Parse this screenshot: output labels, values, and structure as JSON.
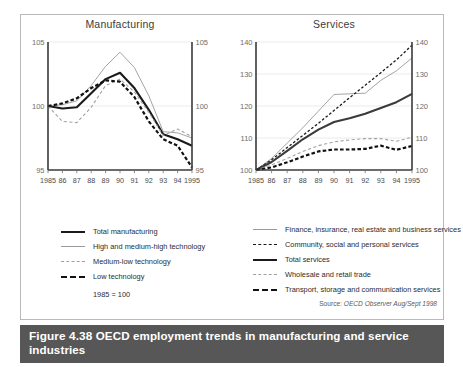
{
  "figure": {
    "number": "Figure 4.38",
    "caption": "OECD employment trends in manufacturing and service industries",
    "source_label": "Source:",
    "source_value": "OECD Observer Aug/Sept 1998"
  },
  "panels": {
    "manufacturing": {
      "title": "Manufacturing",
      "note": "1985 = 100",
      "legend": [
        {
          "label": "Total manufacturing",
          "style": "sw-solid-thick"
        },
        {
          "label": "High and medium-high technology",
          "style": "sw-solid-thin"
        },
        {
          "label": "Medium-low technology",
          "style": "sw-dash-gray"
        },
        {
          "label": "Low technology",
          "style": "sw-dash-black"
        }
      ]
    },
    "services": {
      "title": "Services",
      "legend": [
        {
          "label": "Finance, insurance, real estate and business services",
          "style": "sw-solid-thin"
        },
        {
          "label": "Community, social and personal services",
          "style": "sw-dot-black"
        },
        {
          "label": "Total services",
          "style": "sw-solid-thick"
        },
        {
          "label": "Wholesale and retail trade",
          "style": "sw-dash-gray"
        },
        {
          "label": "Transport, storage and communication services",
          "style": "sw-dash-black"
        }
      ]
    }
  },
  "chart_data": [
    {
      "type": "line",
      "title": "Manufacturing",
      "xlabel": "",
      "ylabel": "",
      "x": [
        1985,
        1986,
        1987,
        1988,
        1989,
        1990,
        1991,
        1992,
        1993,
        1994,
        1995
      ],
      "tick_labels_x": [
        "1985",
        "86",
        "87",
        "88",
        "89",
        "90",
        "91",
        "92",
        "93",
        "94",
        "1995"
      ],
      "tick_labels_y": [
        "95",
        "100",
        "105"
      ],
      "ylim": [
        95,
        105
      ],
      "yticks": [
        95,
        100,
        105
      ],
      "grid": true,
      "axis_right_mirror": true,
      "note": "1985 = 100",
      "series": [
        {
          "name": "Total manufacturing",
          "style": "solid-thick",
          "color": "#1a1a1a",
          "values": [
            100.0,
            99.8,
            99.9,
            101.0,
            102.1,
            102.6,
            101.4,
            99.7,
            97.8,
            97.4,
            96.9
          ]
        },
        {
          "name": "High and medium-high technology",
          "style": "solid-thin",
          "color": "#9a9a9a",
          "values": [
            100.0,
            100.1,
            100.4,
            101.6,
            103.1,
            104.2,
            103.0,
            100.8,
            98.0,
            97.9,
            97.5
          ]
        },
        {
          "name": "Medium-low technology",
          "style": "dash-gray",
          "color": "#a3a3a3",
          "values": [
            100.0,
            98.8,
            98.7,
            99.9,
            101.6,
            102.1,
            101.1,
            99.5,
            97.7,
            98.2,
            97.6
          ]
        },
        {
          "name": "Low technology",
          "style": "dash-black",
          "color": "#111111",
          "values": [
            100.0,
            100.2,
            100.6,
            101.4,
            102.0,
            101.9,
            100.7,
            98.8,
            97.4,
            96.9,
            95.2
          ]
        }
      ]
    },
    {
      "type": "line",
      "title": "Services",
      "xlabel": "",
      "ylabel": "",
      "x": [
        1985,
        1986,
        1987,
        1988,
        1989,
        1990,
        1991,
        1992,
        1993,
        1994,
        1995
      ],
      "tick_labels_x": [
        "1985",
        "86",
        "87",
        "88",
        "89",
        "90",
        "91",
        "92",
        "93",
        "94",
        "1995"
      ],
      "tick_labels_y": [
        "100",
        "110",
        "120",
        "130",
        "140"
      ],
      "ylim": [
        100,
        140
      ],
      "yticks": [
        100,
        110,
        120,
        130,
        140
      ],
      "grid": true,
      "axis_right_mirror": true,
      "series": [
        {
          "name": "Finance, insurance, real estate and business services",
          "style": "solid-thin",
          "color": "#9a9a9a",
          "values": [
            100.0,
            103.6,
            108.4,
            113.2,
            118.4,
            123.6,
            123.8,
            124.0,
            128.0,
            131.0,
            135.0
          ]
        },
        {
          "name": "Community, social and personal services",
          "style": "dot-black",
          "color": "#1a1a1a",
          "values": [
            100.0,
            103.2,
            107.0,
            110.8,
            114.6,
            118.6,
            122.6,
            126.5,
            130.4,
            134.4,
            139.0
          ]
        },
        {
          "name": "Total services",
          "style": "solid-thick",
          "color": "#3a3a3a",
          "values": [
            100.0,
            102.5,
            106.0,
            109.6,
            112.6,
            115.0,
            116.2,
            117.6,
            119.4,
            121.2,
            123.8
          ]
        },
        {
          "name": "Wholesale and retail trade",
          "style": "dash-gray",
          "color": "#a3a3a3",
          "values": [
            100.0,
            101.6,
            103.6,
            105.8,
            107.6,
            108.8,
            109.4,
            109.8,
            109.8,
            109.0,
            110.2
          ]
        },
        {
          "name": "Transport, storage and communication services",
          "style": "dash-black",
          "color": "#111111",
          "values": [
            100.0,
            100.8,
            102.4,
            104.2,
            105.8,
            106.4,
            106.4,
            106.6,
            107.6,
            106.3,
            107.5
          ]
        }
      ]
    }
  ]
}
